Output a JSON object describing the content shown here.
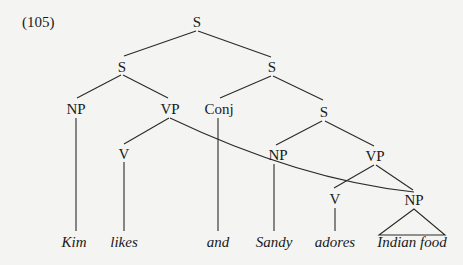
{
  "example_number": "(105)",
  "nodes": {
    "root": "S",
    "s_left": "S",
    "s_right": "S",
    "np_subj1": "NP",
    "vp1": "VP",
    "conj": "Conj",
    "s_lower": "S",
    "v1": "V",
    "np_subj2": "NP",
    "vp2": "VP",
    "v2": "V",
    "np_obj": "NP"
  },
  "words": {
    "kim": "Kim",
    "likes": "likes",
    "and": "and",
    "sandy": "Sandy",
    "adores": "adores",
    "indian_food": "Indian food"
  }
}
